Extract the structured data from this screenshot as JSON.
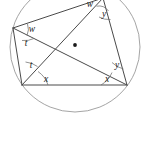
{
  "figure": {
    "shape": "circle-with-inscribed-quadrilateral",
    "stroke_color": "#4a4a4a",
    "circle_color": "#9a9a9a",
    "label_color": "#1a1a1a",
    "background_color": "#ffffff"
  },
  "circle": {
    "cx": 75,
    "cy": 47,
    "r": 65
  },
  "vertices": {
    "top": {
      "x": 103,
      "y": -2
    },
    "left": {
      "x": 13,
      "y": 28
    },
    "bottom_left": {
      "x": 22,
      "y": 85
    },
    "bottom_right": {
      "x": 127,
      "y": 85
    }
  },
  "intersection": {
    "x": 75,
    "y": 45
  },
  "angle_labels": [
    {
      "id": "w-top",
      "text": "w",
      "x": 90,
      "y": 5
    },
    {
      "id": "y-top",
      "text": "y",
      "x": 104,
      "y": 15
    },
    {
      "id": "w-left",
      "text": "w",
      "x": 32,
      "y": 30
    },
    {
      "id": "t-left",
      "text": "t",
      "x": 26,
      "y": 44
    },
    {
      "id": "t-bottom-left",
      "text": "t",
      "x": 31,
      "y": 66
    },
    {
      "id": "x-bottom-left",
      "text": "x",
      "x": 46,
      "y": 80
    },
    {
      "id": "y-bottom-right",
      "text": "y",
      "x": 117,
      "y": 66
    },
    {
      "id": "x-bottom-right",
      "text": "x",
      "x": 107,
      "y": 80
    }
  ],
  "angle_arcs": [
    {
      "id": "arc-w-top",
      "d": "M 96.5 6.2 A 12 12 0 0 1 108.5 11.0"
    },
    {
      "id": "arc-y-top",
      "d": "M 99.0 17.0 A 20 20 0 0 0 110.5 19.5"
    },
    {
      "id": "arc-w-left",
      "d": "M 27.5 24.0 A 15 15 0 0 1 27.0 35.5"
    },
    {
      "id": "arc-t-left",
      "d": "M 22.0 40.5 A 22 22 0 0 0 34.0 38.5"
    },
    {
      "id": "arc-t-bl",
      "d": "M 25.5 62.0 A 24 24 0 0 1 37.5 66.5"
    },
    {
      "id": "arc-x-bl",
      "d": "M 38.0 71.5 A 26 26 0 0 1 48.0 85.0"
    },
    {
      "id": "arc-y-br",
      "d": "M 112.0 62.5 A 24 24 0 0 0 123.5 69.0"
    },
    {
      "id": "arc-x-br",
      "d": "M 101.0 85.0 A 26 26 0 0 0 112.0 72.5"
    }
  ],
  "segments": {
    "quad_sides": [
      {
        "id": "side-left-top",
        "x1": 13,
        "y1": 28,
        "x2": 103,
        "y2": -2
      },
      {
        "id": "side-top-bottomright",
        "x1": 103,
        "y1": -2,
        "x2": 127,
        "y2": 85
      },
      {
        "id": "side-bottomright-bottomleft",
        "x1": 127,
        "y1": 85,
        "x2": 22,
        "y2": 85
      },
      {
        "id": "side-bottomleft-left",
        "x1": 22,
        "y1": 85,
        "x2": 13,
        "y2": 28
      }
    ],
    "diagonals": [
      {
        "id": "diagonal-left-to-bottomright",
        "x1": 13,
        "y1": 28,
        "x2": 127,
        "y2": 85
      },
      {
        "id": "diagonal-top-to-bottomleft",
        "x1": 103,
        "y1": -2,
        "x2": 22,
        "y2": 85
      }
    ]
  }
}
